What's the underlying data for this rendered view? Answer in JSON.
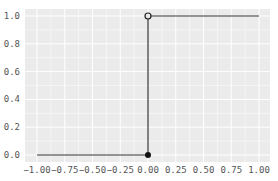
{
  "chart_data": {
    "type": "line",
    "title": "",
    "xlabel": "",
    "ylabel": "",
    "xlim": [
      -1.0,
      1.0
    ],
    "ylim": [
      0.0,
      1.0
    ],
    "grid": true,
    "background": "#ebebeb",
    "grid_color": "#ffffff",
    "line_color": "#333333",
    "x_ticks": [
      "-1.00",
      "-0.75",
      "-0.50",
      "-0.25",
      "0.00",
      "0.25",
      "0.50",
      "0.75",
      "1.00"
    ],
    "y_ticks": [
      "0.0",
      "0.2",
      "0.4",
      "0.6",
      "0.8",
      "1.0"
    ],
    "series": [
      {
        "name": "step-left",
        "x": [
          -1.0,
          0.0
        ],
        "y": [
          0.0,
          0.0
        ]
      },
      {
        "name": "step-jump",
        "x": [
          0.0,
          0.0
        ],
        "y": [
          0.0,
          1.0
        ]
      },
      {
        "name": "step-right",
        "x": [
          0.0,
          1.0
        ],
        "y": [
          1.0,
          1.0
        ]
      }
    ],
    "markers": [
      {
        "x": 0.0,
        "y": 0.0,
        "style": "filled"
      },
      {
        "x": 0.0,
        "y": 1.0,
        "style": "open"
      }
    ]
  }
}
